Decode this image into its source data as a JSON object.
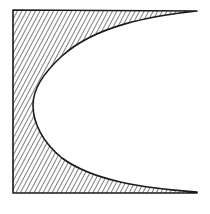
{
  "figure": {
    "colors": {
      "background": "#ffffff",
      "outline": "#1a1a1a",
      "hatch": "#3a3a3a"
    },
    "shape": {
      "left_edge_x": 13,
      "top_edge_y": 10,
      "bottom_edge_y": 193,
      "right_tip_x": 197,
      "cavity_vertex": [
        33,
        105
      ]
    }
  }
}
